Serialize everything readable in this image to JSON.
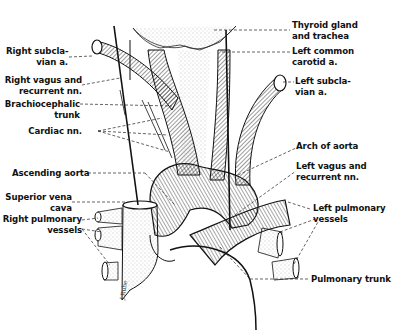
{
  "figure": {
    "labels_left": [
      {
        "id": "right-subclavian",
        "lines": [
          "Right subcla-",
          "vian a."
        ]
      },
      {
        "id": "right-vagus",
        "lines": [
          "Right vagus and",
          "recurrent nn."
        ]
      },
      {
        "id": "brachiocephalic",
        "lines": [
          "Brachiocephalic",
          "trunk"
        ]
      },
      {
        "id": "cardiac-nn",
        "lines": [
          "Cardiac nn."
        ]
      },
      {
        "id": "ascending-aorta",
        "lines": [
          "Ascending aorta"
        ]
      },
      {
        "id": "svc",
        "lines": [
          "Superior vena",
          "cava"
        ]
      },
      {
        "id": "right-pulmonary",
        "lines": [
          "Right pulmonary",
          "vessels"
        ]
      }
    ],
    "labels_right": [
      {
        "id": "thyroid",
        "lines": [
          "Thyroid gland",
          "and trachea"
        ]
      },
      {
        "id": "left-common-carotid",
        "lines": [
          "Left common",
          "carotid a."
        ]
      },
      {
        "id": "left-subclavian",
        "lines": [
          "Left subcla-",
          "vian a."
        ]
      },
      {
        "id": "arch-aorta",
        "lines": [
          "Arch of aorta"
        ]
      },
      {
        "id": "left-vagus",
        "lines": [
          "Left vagus and",
          "recurrent nn."
        ]
      },
      {
        "id": "left-pulmonary",
        "lines": [
          "Left pulmonary",
          "vessels"
        ]
      },
      {
        "id": "pulmonary-trunk",
        "lines": [
          "Pulmonary trunk"
        ]
      }
    ],
    "colors": {
      "ink": "#111111",
      "background": "#ffffff",
      "stipple": "#9a9a9a"
    }
  }
}
